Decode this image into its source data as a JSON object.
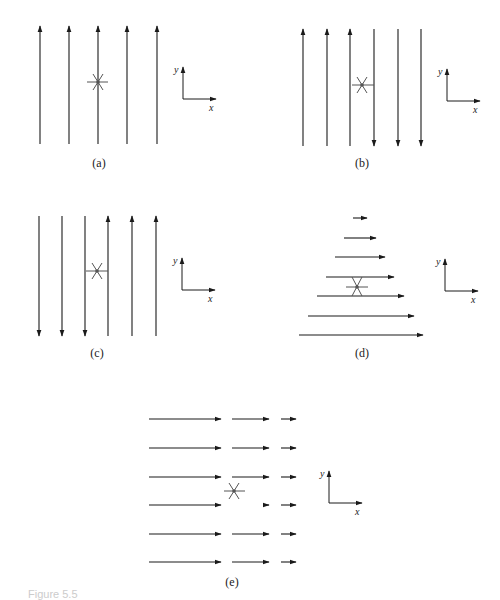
{
  "colors": {
    "line": "#1a1a1a",
    "marker": "#555555"
  },
  "panels": [
    {
      "id": "a",
      "label": "(a)",
      "label_pos": [
        99,
        167
      ],
      "arrows": [
        {
          "x1": 40,
          "y1": 144,
          "x2": 40,
          "y2": 26
        },
        {
          "x1": 69,
          "y1": 144,
          "x2": 69,
          "y2": 26
        },
        {
          "x1": 98,
          "y1": 144,
          "x2": 98,
          "y2": 26
        },
        {
          "x1": 127,
          "y1": 144,
          "x2": 127,
          "y2": 26
        },
        {
          "x1": 157,
          "y1": 144,
          "x2": 157,
          "y2": 26
        }
      ],
      "marker": {
        "x": 98,
        "y": 82,
        "hbar": [
          87,
          108
        ],
        "style": "star"
      },
      "axes": {
        "ox": 183,
        "oy": 99,
        "x_label": "x",
        "y_label": "y"
      }
    },
    {
      "id": "b",
      "label": "(b)",
      "label_pos": [
        362,
        167
      ],
      "arrows": [
        {
          "x1": 303,
          "y1": 146,
          "x2": 303,
          "y2": 29
        },
        {
          "x1": 327,
          "y1": 146,
          "x2": 327,
          "y2": 29
        },
        {
          "x1": 350,
          "y1": 146,
          "x2": 350,
          "y2": 29
        },
        {
          "x1": 374,
          "y1": 29,
          "x2": 374,
          "y2": 146
        },
        {
          "x1": 398,
          "y1": 29,
          "x2": 398,
          "y2": 146
        },
        {
          "x1": 421,
          "y1": 29,
          "x2": 421,
          "y2": 146
        }
      ],
      "marker": {
        "x": 362,
        "y": 85,
        "hbar": [
          352,
          374
        ],
        "style": "star"
      },
      "axes": {
        "ox": 447,
        "oy": 101,
        "x_label": "x",
        "y_label": "y"
      }
    },
    {
      "id": "c",
      "label": "(c)",
      "label_pos": [
        97,
        357
      ],
      "arrows": [
        {
          "x1": 39,
          "y1": 216,
          "x2": 39,
          "y2": 336
        },
        {
          "x1": 62,
          "y1": 216,
          "x2": 62,
          "y2": 336
        },
        {
          "x1": 85,
          "y1": 216,
          "x2": 85,
          "y2": 336
        },
        {
          "x1": 108,
          "y1": 336,
          "x2": 108,
          "y2": 216
        },
        {
          "x1": 132,
          "y1": 336,
          "x2": 132,
          "y2": 216
        },
        {
          "x1": 156,
          "y1": 336,
          "x2": 156,
          "y2": 216
        }
      ],
      "marker": {
        "x": 97,
        "y": 271,
        "hbar": [
          86,
          108
        ],
        "style": "star"
      },
      "axes": {
        "ox": 182,
        "oy": 290,
        "x_label": "x",
        "y_label": "y"
      }
    },
    {
      "id": "d",
      "label": "(d)",
      "label_pos": [
        362,
        357
      ],
      "arrows": [
        {
          "x1": 353,
          "y1": 218,
          "x2": 367,
          "y2": 218
        },
        {
          "x1": 344,
          "y1": 238,
          "x2": 376,
          "y2": 238
        },
        {
          "x1": 335,
          "y1": 257,
          "x2": 385,
          "y2": 257
        },
        {
          "x1": 326,
          "y1": 277,
          "x2": 394,
          "y2": 277
        },
        {
          "x1": 317,
          "y1": 296,
          "x2": 404,
          "y2": 296
        },
        {
          "x1": 308,
          "y1": 316,
          "x2": 414,
          "y2": 316
        },
        {
          "x1": 299,
          "y1": 335,
          "x2": 423,
          "y2": 335
        }
      ],
      "marker": {
        "x": 357,
        "y": 287,
        "hbar": [
          346,
          368
        ],
        "style": "hourglass",
        "span": [
          277,
          296
        ]
      },
      "axes": {
        "ox": 445,
        "oy": 291,
        "x_label": "x",
        "y_label": "y"
      }
    },
    {
      "id": "e",
      "label": "(e)",
      "label_pos": [
        232,
        586
      ],
      "arrows": [
        {
          "x1": 149,
          "y1": 419,
          "x2": 221,
          "y2": 419
        },
        {
          "x1": 232,
          "y1": 419,
          "x2": 269,
          "y2": 419
        },
        {
          "x1": 281,
          "y1": 419,
          "x2": 296,
          "y2": 419
        },
        {
          "x1": 149,
          "y1": 448,
          "x2": 221,
          "y2": 448
        },
        {
          "x1": 232,
          "y1": 448,
          "x2": 269,
          "y2": 448
        },
        {
          "x1": 281,
          "y1": 448,
          "x2": 296,
          "y2": 448
        },
        {
          "x1": 149,
          "y1": 477,
          "x2": 221,
          "y2": 477
        },
        {
          "x1": 232,
          "y1": 477,
          "x2": 269,
          "y2": 477
        },
        {
          "x1": 281,
          "y1": 477,
          "x2": 296,
          "y2": 477
        },
        {
          "x1": 149,
          "y1": 505,
          "x2": 221,
          "y2": 505
        },
        {
          "x1": 265,
          "y1": 505,
          "x2": 269,
          "y2": 505
        },
        {
          "x1": 281,
          "y1": 505,
          "x2": 296,
          "y2": 505
        },
        {
          "x1": 149,
          "y1": 534,
          "x2": 221,
          "y2": 534
        },
        {
          "x1": 232,
          "y1": 534,
          "x2": 269,
          "y2": 534
        },
        {
          "x1": 281,
          "y1": 534,
          "x2": 296,
          "y2": 534
        },
        {
          "x1": 149,
          "y1": 562,
          "x2": 221,
          "y2": 562
        },
        {
          "x1": 232,
          "y1": 562,
          "x2": 269,
          "y2": 562
        },
        {
          "x1": 281,
          "y1": 562,
          "x2": 296,
          "y2": 562
        }
      ],
      "marker": {
        "x": 234,
        "y": 491,
        "hbar": [
          224,
          245
        ],
        "style": "star"
      },
      "axes": {
        "ox": 329,
        "oy": 503,
        "x_label": "x",
        "y_label": "y"
      }
    }
  ],
  "caption": "Figure 5.5"
}
